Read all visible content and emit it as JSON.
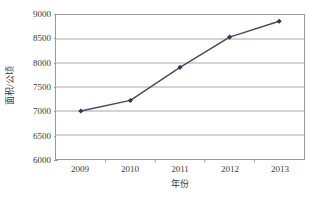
{
  "chart_data": {
    "type": "line",
    "title": "",
    "subtitle": "",
    "xlabel": "年份",
    "ylabel": "面积/公顷",
    "categories": [
      "2009",
      "2010",
      "2011",
      "2012",
      "2013"
    ],
    "values": [
      7000,
      7220,
      7910,
      8540,
      8870
    ],
    "series": [
      {
        "name": "面积/公顷",
        "values": [
          7000,
          7220,
          7910,
          8540,
          8870
        ]
      }
    ],
    "ylim": [
      6000,
      9000
    ],
    "ytick_labels": [
      "6000",
      "6500",
      "7000",
      "7500",
      "8000",
      "8500",
      "9000"
    ],
    "ytick_values": [
      6000,
      6500,
      7000,
      7500,
      8000,
      8500,
      9000
    ],
    "xtick_labels": [
      "2009",
      "2010",
      "2011",
      "2012",
      "2013"
    ],
    "grid": "horizontal",
    "legend": "none",
    "legend_position": "none",
    "annotations": [],
    "colors": {
      "line": "#3f4a63",
      "marker": "#2f3950",
      "gridline": "#a6a6a6",
      "axis": "#9a9a9a",
      "text": "#3a3a3a",
      "background": "#ffffff"
    },
    "marker_style": "diamond",
    "line_width": 1.4
  }
}
